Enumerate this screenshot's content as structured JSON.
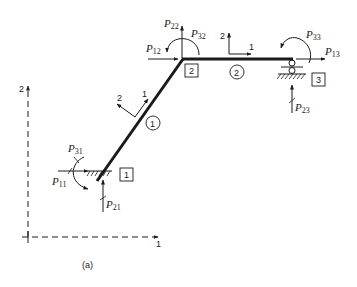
{
  "figure": {
    "caption": "(a)",
    "global_axes": {
      "x_label": "1",
      "y_label": "2"
    },
    "members": [
      {
        "id": "1",
        "label": "1",
        "local_axes": {
          "axis1": "1",
          "axis2": "2"
        }
      },
      {
        "id": "2",
        "label": "2",
        "local_axes": {
          "axis1": "1",
          "axis2": "2"
        }
      }
    ],
    "nodes": [
      {
        "id": "1",
        "label": "1",
        "support": "fixed"
      },
      {
        "id": "2",
        "label": "2",
        "support": "free"
      },
      {
        "id": "3",
        "label": "3",
        "support": "roller-pin"
      }
    ],
    "loads": {
      "P11": {
        "sym": "P",
        "sub": "11"
      },
      "P21": {
        "sym": "P",
        "sub": "21"
      },
      "P31": {
        "sym": "P",
        "sub": "31"
      },
      "P12": {
        "sym": "P",
        "sub": "12"
      },
      "P22": {
        "sym": "P",
        "sub": "22"
      },
      "P32": {
        "sym": "P",
        "sub": "32"
      },
      "P13": {
        "sym": "P",
        "sub": "13"
      },
      "P23": {
        "sym": "P",
        "sub": "23"
      },
      "P33": {
        "sym": "P",
        "sub": "33"
      }
    },
    "colors": {
      "ink": "#1a1a1a",
      "background": "#ffffff"
    }
  }
}
